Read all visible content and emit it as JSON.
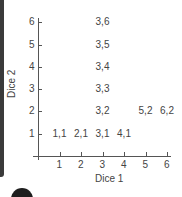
{
  "chart_data": {
    "type": "scatter",
    "title": "",
    "xlabel": "Dice 1",
    "ylabel": "Dice 2",
    "x_ticks": [
      1,
      2,
      3,
      4,
      5,
      6
    ],
    "y_ticks": [
      1,
      2,
      3,
      4,
      5,
      6
    ],
    "xlim": [
      0,
      6
    ],
    "ylim": [
      0,
      6
    ],
    "grid": false,
    "points": [
      {
        "x": 1,
        "y": 1,
        "label": "1,1"
      },
      {
        "x": 2,
        "y": 1,
        "label": "2,1"
      },
      {
        "x": 3,
        "y": 1,
        "label": "3,1"
      },
      {
        "x": 4,
        "y": 1,
        "label": "4,1"
      },
      {
        "x": 3,
        "y": 2,
        "label": "3,2"
      },
      {
        "x": 5,
        "y": 2,
        "label": "5,2"
      },
      {
        "x": 6,
        "y": 2,
        "label": "6,2"
      },
      {
        "x": 3,
        "y": 3,
        "label": "3,3"
      },
      {
        "x": 3,
        "y": 4,
        "label": "3,4"
      },
      {
        "x": 3,
        "y": 5,
        "label": "3,5"
      },
      {
        "x": 3,
        "y": 6,
        "label": "3,6"
      }
    ]
  }
}
